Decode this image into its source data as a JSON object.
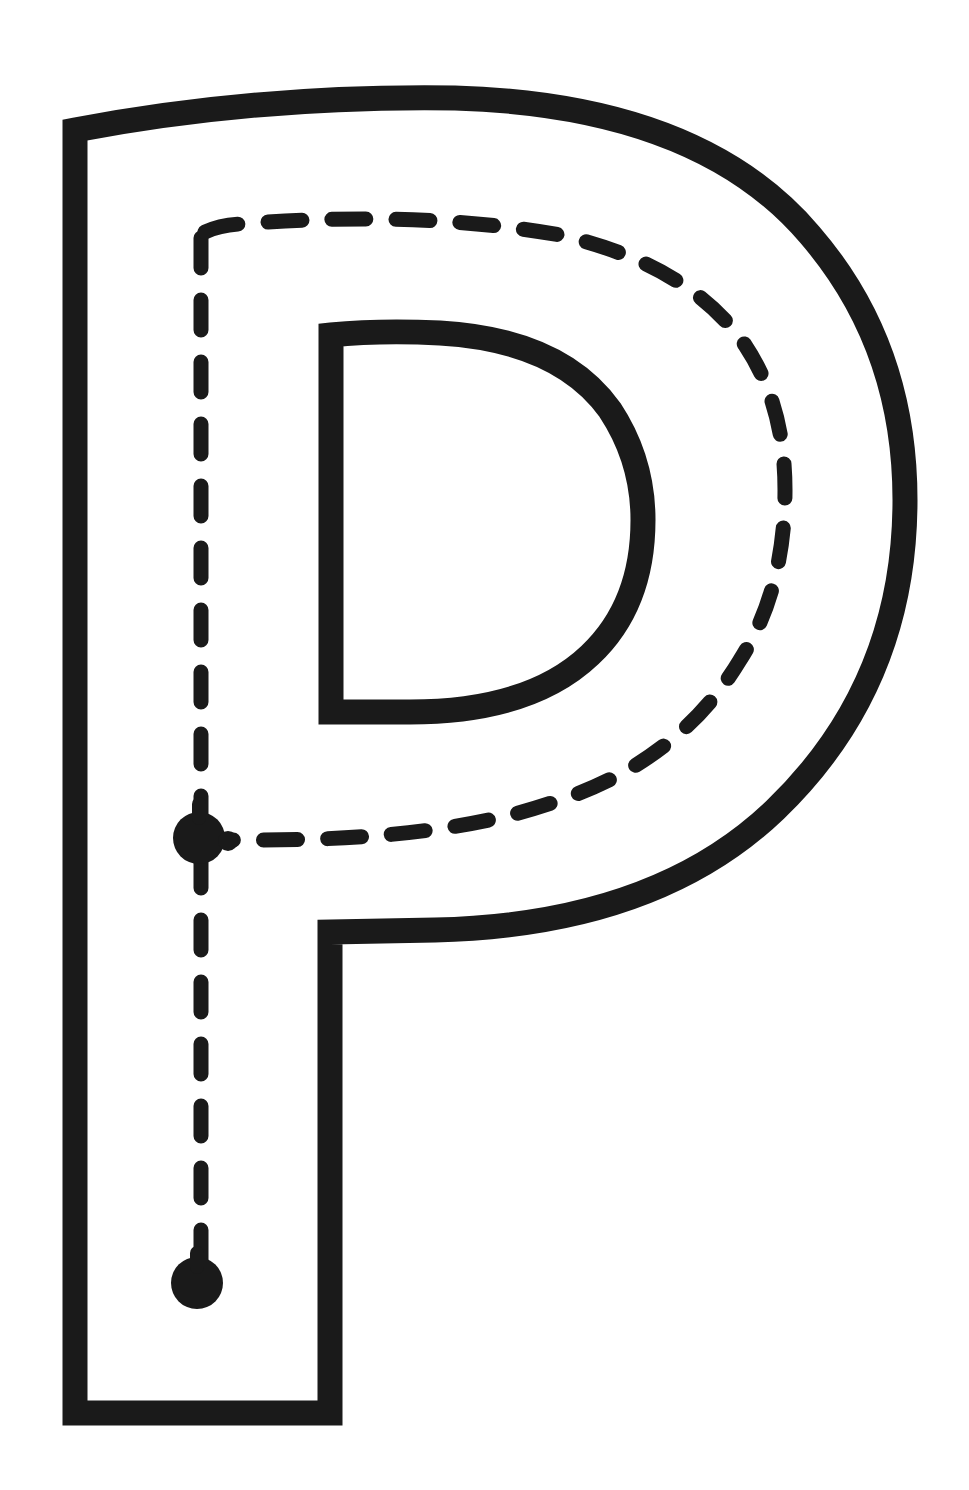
{
  "worksheet": {
    "letter": "P",
    "description": "Letter P tracing outline with dashed guide path",
    "colors": {
      "outline": "#1a1a1a",
      "guide": "#1a1a1a",
      "background": "#ffffff"
    },
    "guide": {
      "start_dot": "bottom",
      "junction_dot": "middle-left",
      "stroke_style": "dashed"
    }
  }
}
